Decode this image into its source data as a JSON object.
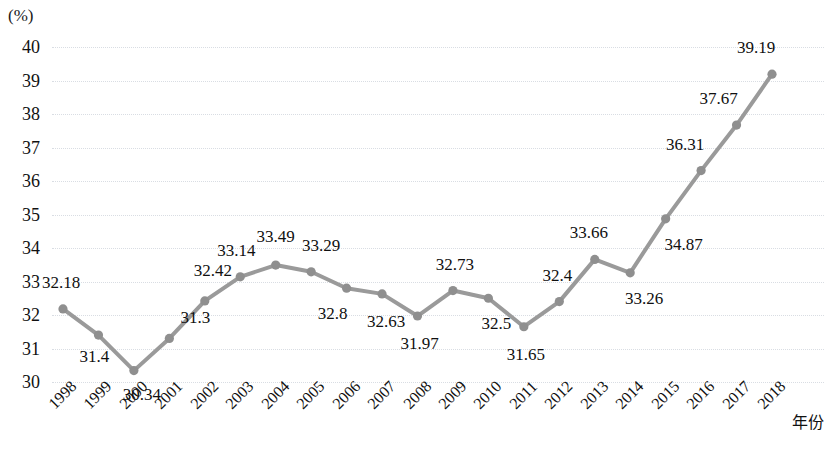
{
  "chart_data": {
    "type": "line",
    "title": "",
    "subtitle": "",
    "xlabel": "年份",
    "ylabel": "(%)",
    "yunit": "(%)",
    "categories": [
      "1998",
      "1999",
      "2000",
      "2001",
      "2002",
      "2003",
      "2004",
      "2005",
      "2006",
      "2007",
      "2008",
      "2009",
      "2010",
      "2011",
      "2012",
      "2013",
      "2014",
      "2015",
      "2016",
      "2017",
      "2018"
    ],
    "values": [
      32.18,
      31.4,
      30.34,
      31.3,
      32.42,
      33.14,
      33.49,
      33.29,
      32.8,
      32.63,
      31.97,
      32.73,
      32.5,
      31.65,
      32.4,
      33.66,
      33.26,
      34.87,
      36.31,
      37.67,
      39.19
    ],
    "point_labels": [
      "32.18",
      "31.4",
      "30.34",
      "31.3",
      "32.42",
      "33.14",
      "33.49",
      "33.29",
      "32.8",
      "32.63",
      "31.97",
      "32.73",
      "32.5",
      "31.65",
      "32.4",
      "33.66",
      "33.26",
      "34.87",
      "36.31",
      "37.67",
      "39.19"
    ],
    "ylim": [
      30,
      40
    ],
    "ytick_labels": [
      "40",
      "39",
      "38",
      "37",
      "36",
      "35",
      "34",
      "33",
      "32",
      "31",
      "30"
    ],
    "ytick_values": [
      40,
      39,
      38,
      37,
      36,
      35,
      34,
      33,
      32,
      31,
      30
    ],
    "grid": true,
    "grid_axis": "y",
    "legend": false,
    "legend_position": "none",
    "series": [
      {
        "name": "",
        "values": [
          32.18,
          31.4,
          30.34,
          31.3,
          32.42,
          33.14,
          33.49,
          33.29,
          32.8,
          32.63,
          31.97,
          32.73,
          32.5,
          31.65,
          32.4,
          33.66,
          33.26,
          34.87,
          36.31,
          37.67,
          39.19
        ],
        "color": "#999999",
        "marker": "circle"
      }
    ],
    "colors": {
      "line": "#9a9a9a",
      "marker": "#8f8f8f",
      "grid": "#dfe3e9",
      "text": "#111111",
      "background": "#ffffff"
    },
    "label_offsets": [
      {
        "dx": -2,
        "dy": -26
      },
      {
        "dx": -4,
        "dy": 22
      },
      {
        "dx": 8,
        "dy": 24
      },
      {
        "dx": 26,
        "dy": -20
      },
      {
        "dx": 8,
        "dy": -30
      },
      {
        "dx": -4,
        "dy": -26
      },
      {
        "dx": 0,
        "dy": -28
      },
      {
        "dx": 10,
        "dy": -26
      },
      {
        "dx": -14,
        "dy": 26
      },
      {
        "dx": 4,
        "dy": 28
      },
      {
        "dx": 2,
        "dy": 28
      },
      {
        "dx": 2,
        "dy": -26
      },
      {
        "dx": 8,
        "dy": 26
      },
      {
        "dx": 2,
        "dy": 28
      },
      {
        "dx": -2,
        "dy": -26
      },
      {
        "dx": -6,
        "dy": -26
      },
      {
        "dx": 14,
        "dy": 26
      },
      {
        "dx": 18,
        "dy": 26
      },
      {
        "dx": -16,
        "dy": -26
      },
      {
        "dx": -18,
        "dy": -26
      },
      {
        "dx": -16,
        "dy": -26
      }
    ]
  }
}
